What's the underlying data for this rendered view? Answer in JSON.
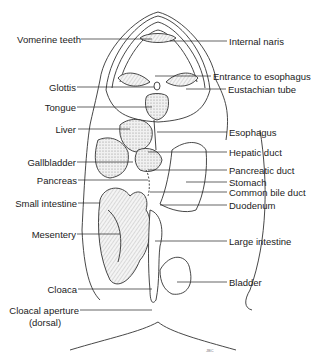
{
  "diagram": {
    "labels_left": [
      {
        "id": "vomerine-teeth",
        "text": "Vomerine teeth",
        "x": 15,
        "y": 34,
        "w": 66,
        "line": [
          81,
          39,
          152,
          39
        ]
      },
      {
        "id": "glottis",
        "text": "Glottis",
        "x": 40,
        "y": 82,
        "w": 36,
        "line": [
          77,
          87,
          154,
          87
        ]
      },
      {
        "id": "tongue",
        "text": "Tongue",
        "x": 40,
        "y": 102,
        "w": 36,
        "line": [
          77,
          107,
          152,
          107
        ]
      },
      {
        "id": "liver",
        "text": "Liver",
        "x": 40,
        "y": 124,
        "w": 36,
        "line": [
          78,
          129,
          130,
          129
        ]
      },
      {
        "id": "gallbladder",
        "text": "Gallbladder",
        "x": 20,
        "y": 157,
        "w": 56,
        "line": [
          77,
          162,
          133,
          162
        ]
      },
      {
        "id": "pancreas",
        "text": "Pancreas",
        "x": 30,
        "y": 175,
        "w": 47,
        "line": [
          78,
          180,
          148,
          180
        ]
      },
      {
        "id": "small-intestine",
        "text": "Small intestine",
        "x": 6,
        "y": 198,
        "w": 71,
        "line": [
          78,
          203,
          100,
          203
        ]
      },
      {
        "id": "mesentery",
        "text": "Mesentery",
        "x": 28,
        "y": 229,
        "w": 48,
        "line": [
          77,
          234,
          120,
          234
        ]
      },
      {
        "id": "cloaca",
        "text": "Cloaca",
        "x": 40,
        "y": 284,
        "w": 37,
        "line": [
          78,
          289,
          152,
          289
        ]
      },
      {
        "id": "cloacal-aperture",
        "text": "Cloacal aperture",
        "x": 6,
        "y": 305,
        "w": 73,
        "line": [
          80,
          310,
          152,
          310
        ]
      }
    ],
    "cloacal_aperture_sub": "(dorsal)",
    "labels_right": [
      {
        "id": "internal-naris",
        "text": "Internal naris",
        "x": 229,
        "y": 36,
        "line": [
          170,
          41,
          227,
          41
        ]
      },
      {
        "id": "entrance-to-esophagus",
        "text": "Entrance to esophagus",
        "x": 213,
        "y": 71,
        "line": [
          155,
          76,
          211,
          76
        ]
      },
      {
        "id": "eustachian-tube",
        "text": "Eustachian tube",
        "x": 228,
        "y": 84,
        "line": [
          186,
          89,
          226,
          89
        ]
      },
      {
        "id": "esophagus",
        "text": "Esophagus",
        "x": 229,
        "y": 127,
        "line": [
          157,
          132,
          227,
          132
        ]
      },
      {
        "id": "hepatic-duct",
        "text": "Hepatic duct",
        "x": 229,
        "y": 147,
        "line": [
          148,
          152,
          227,
          152
        ]
      },
      {
        "id": "pancreatic-duct",
        "text": "Pancreatic duct",
        "x": 229,
        "y": 165,
        "line": [
          148,
          170,
          227,
          170
        ]
      },
      {
        "id": "stomach",
        "text": "Stomach",
        "x": 229,
        "y": 177,
        "line": [
          186,
          182,
          227,
          182
        ]
      },
      {
        "id": "common-bile-duct",
        "text": "Common bile duct",
        "x": 229,
        "y": 187,
        "line": [
          150,
          192,
          227,
          192
        ]
      },
      {
        "id": "duodenum",
        "text": "Duodenum",
        "x": 229,
        "y": 200,
        "line": [
          160,
          205,
          227,
          205
        ]
      },
      {
        "id": "large-intestine",
        "text": "Large intestine",
        "x": 229,
        "y": 236,
        "line": [
          155,
          241,
          227,
          241
        ]
      },
      {
        "id": "bladder",
        "text": "Bladder",
        "x": 229,
        "y": 277,
        "line": [
          177,
          282,
          227,
          282
        ]
      }
    ],
    "artist_mark": "JBC",
    "colors": {
      "ink": "#222222",
      "shade": "#8a8a8a",
      "fill": "#e6e6e6",
      "background": "#ffffff"
    }
  }
}
